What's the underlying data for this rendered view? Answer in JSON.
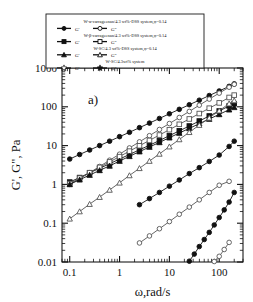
{
  "figure": {
    "panel_label": "a)",
    "background": "#ffffff",
    "frame_color": "#1a1a1a"
  },
  "chart_data": {
    "type": "line",
    "title": "",
    "subtitle": "",
    "panel_label": "a)",
    "xlabel": "ω,rad/s",
    "ylabel": "G', G\", Pa",
    "xscale": "log",
    "yscale": "log",
    "xlim": [
      0.07,
      300
    ],
    "ylim": [
      0.01,
      1000
    ],
    "xticks": [
      0.1,
      1,
      10,
      100
    ],
    "xticklabels": [
      "0.1",
      "1",
      "10",
      "100"
    ],
    "yticks": [
      0.01,
      0.1,
      1,
      10,
      100,
      1000
    ],
    "yticklabels": [
      "0.01",
      "0.1",
      "1",
      "10",
      "100",
      "1000"
    ],
    "grid": false,
    "minor_ticks": true,
    "legend_position": "top-center",
    "series": [
      {
        "name": "W-α-carrageenan/4.3 wt%-DSS system, φ=0.14  G'",
        "short": "alpha-G'",
        "marker": "filled-circle",
        "color": "#111111",
        "x": [
          0.1,
          0.158,
          0.251,
          0.398,
          0.631,
          1.0,
          1.58,
          2.51,
          3.98,
          6.31,
          10.0,
          15.8,
          25.1,
          39.8,
          63.1,
          100.0,
          158.0,
          200.0
        ],
        "y": [
          4.5,
          5.9,
          7.7,
          10.0,
          13.0,
          17.0,
          22.0,
          29.0,
          38.0,
          50.0,
          66.0,
          86.0,
          113.0,
          148.0,
          195.0,
          256.0,
          336.0,
          390.0
        ]
      },
      {
        "name": "W-α-carrageenan/4.3 wt%-DSS system, φ=0.14  G\"",
        "short": "alpha-G''",
        "marker": "open-circle",
        "color": "#555555",
        "x": [
          0.1,
          0.158,
          0.251,
          0.398,
          0.631,
          1.0,
          1.58,
          2.51,
          3.98,
          6.31,
          10.0,
          15.8,
          25.1,
          39.8,
          63.1,
          100.0,
          158.0,
          200.0
        ],
        "y": [
          1.0,
          1.4,
          2.0,
          2.9,
          4.2,
          6.0,
          8.7,
          12.5,
          18.0,
          26.0,
          37.0,
          53.0,
          76.0,
          110.0,
          158.0,
          225.0,
          320.0,
          380.0
        ]
      },
      {
        "name": "W-β-carrageenan/4.3 wt%-DSS system, φ=0.14  G'",
        "short": "beta-G'",
        "marker": "filled-square",
        "color": "#111111",
        "x": [
          0.1,
          0.158,
          0.251,
          0.398,
          0.631,
          1.0,
          1.58,
          2.51,
          3.98,
          6.31,
          10.0,
          15.8,
          25.1,
          39.8,
          63.1,
          100.0,
          158.0,
          200.0
        ],
        "y": [
          1.15,
          1.5,
          2.0,
          2.6,
          3.4,
          4.5,
          5.9,
          7.8,
          10.2,
          13.5,
          18.0,
          24.0,
          32.0,
          43.0,
          58.0,
          78.0,
          105.0,
          120.0
        ]
      },
      {
        "name": "W-β-carrageenan/4.3 wt%-DSS system, φ=0.14  G\"",
        "short": "beta-G''",
        "marker": "open-square",
        "color": "#555555",
        "x": [
          0.1,
          0.158,
          0.251,
          0.398,
          0.631,
          1.0,
          1.58,
          2.51,
          3.98,
          6.31,
          10.0,
          15.8,
          25.1,
          39.8,
          63.1,
          100.0,
          158.0,
          200.0
        ],
        "y": [
          1.05,
          1.45,
          2.0,
          2.75,
          3.8,
          5.2,
          7.2,
          9.9,
          13.6,
          18.7,
          25.7,
          35.4,
          48.6,
          67.0,
          92.0,
          126.0,
          174.0,
          200.0
        ]
      },
      {
        "name": "W-SC/4.3 wt%-DSS system, φ=0.14  G'",
        "short": "sc-dss-G'",
        "marker": "filled-triangle",
        "color": "#111111",
        "x": [
          0.1,
          0.158,
          0.251,
          0.398,
          0.631,
          1.0,
          1.58,
          2.51,
          3.98,
          6.31,
          10.0,
          15.8,
          25.1,
          39.8,
          63.1,
          100.0,
          158.0,
          200.0
        ],
        "y": [
          1.0,
          1.32,
          1.74,
          2.3,
          3.0,
          4.0,
          5.3,
          7.0,
          9.2,
          12.1,
          16.0,
          21.1,
          27.8,
          36.7,
          48.4,
          63.8,
          84.2,
          97.0
        ]
      },
      {
        "name": "W-SC/4.3 wt%-DSS system, φ=0.14  G\"",
        "short": "sc-dss-G''",
        "marker": "open-triangle",
        "color": "#555555",
        "x": [
          0.1,
          0.158,
          0.251,
          0.398,
          0.631,
          1.0,
          1.58,
          2.51,
          3.98,
          6.31,
          10.0,
          15.8,
          25.1,
          39.8,
          63.1,
          100.0,
          158.0,
          200.0
        ],
        "y": [
          0.13,
          0.2,
          0.31,
          0.47,
          0.72,
          1.1,
          1.7,
          2.6,
          4.0,
          6.1,
          9.4,
          14.4,
          22.1,
          33.8,
          51.8,
          79.4,
          121.0,
          145.0
        ]
      },
      {
        "name": "W-SC/4.3 wt% system  G'",
        "short": "sc-G'",
        "marker": "filled-circle",
        "color": "#111111",
        "x": [
          2.51,
          3.98,
          6.31,
          10.0,
          15.8,
          25.1,
          39.8,
          63.1,
          100.0,
          158.0,
          200.0
        ],
        "y": [
          0.3,
          0.43,
          0.62,
          0.9,
          1.3,
          1.9,
          2.7,
          3.9,
          5.7,
          9.5,
          13.0
        ]
      },
      {
        "name": "W-SC/4.3 wt% system  G\"",
        "short": "sc-G''",
        "marker": "open-circle",
        "color": "#555555",
        "x": [
          2.51,
          3.98,
          6.31,
          10.0,
          15.8,
          25.1,
          39.8,
          63.1,
          100.0,
          158.0
        ],
        "y": [
          0.031,
          0.047,
          0.072,
          0.11,
          0.17,
          0.26,
          0.4,
          0.62,
          0.95,
          1.2
        ]
      },
      {
        "name": "W-SC/4.3 wt% system  G' (low)",
        "short": "sc-low-filled",
        "marker": "filled-circle",
        "color": "#111111",
        "x": [
          25.1,
          31.6,
          39.8,
          50.1,
          63.1,
          79.4,
          100.0,
          126.0,
          158.0,
          200.0
        ],
        "y": [
          0.0105,
          0.016,
          0.025,
          0.038,
          0.058,
          0.09,
          0.14,
          0.22,
          0.35,
          0.62
        ]
      },
      {
        "name": "W-SC/4.3 wt% system  G\" (low)",
        "short": "sc-low-open",
        "marker": "open-circle",
        "color": "#555555",
        "x": [
          79.4,
          100.0,
          126.0,
          158.0
        ],
        "y": [
          0.0103,
          0.014,
          0.021,
          0.032
        ]
      }
    ]
  },
  "legend": {
    "border_color": "#1a1a1a",
    "entries": [
      {
        "system_label": "W-α-carrageenan/4.3 wt%-DSS system,φ=0.14",
        "items": [
          {
            "label": "G'",
            "marker": "filled-circle"
          },
          {
            "label": "G\"",
            "marker": "open-circle"
          }
        ]
      },
      {
        "system_label": "W-β-carrageenan/4.3 wt%-DSS system,φ=0.14",
        "items": [
          {
            "label": "G'",
            "marker": "filled-square"
          },
          {
            "label": "G\"",
            "marker": "open-square"
          }
        ]
      },
      {
        "system_label": "W-SC/4.3 wt%-DSS system,φ=0.14",
        "items": [
          {
            "label": "G'",
            "marker": "filled-triangle"
          },
          {
            "label": "G\"",
            "marker": "open-triangle"
          }
        ]
      },
      {
        "system_label": "W-SC/4.3wt% system",
        "items": [
          {
            "label": "G'",
            "marker": "open-star"
          },
          {
            "label": "G\"",
            "marker": "filled-star"
          }
        ]
      }
    ]
  }
}
